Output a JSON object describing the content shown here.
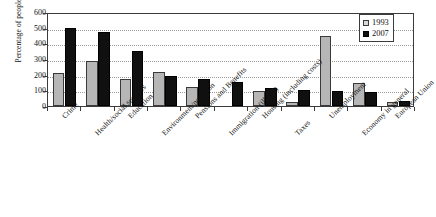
{
  "chart_data": {
    "type": "bar",
    "title": "",
    "xlabel": "",
    "ylabel": "Percentage of people",
    "ylim": [
      0,
      600
    ],
    "yticks": [
      0,
      100,
      200,
      300,
      400,
      500,
      600
    ],
    "ytick_labels": [
      "0",
      "100",
      "200",
      "300",
      "400",
      "500",
      "600"
    ],
    "grid": true,
    "legend_position": "top-right",
    "categories": [
      "Crime",
      "Health/social services",
      "Education",
      "Environment/pollution",
      "Pensions and Benefits",
      "Immigration (illegal)",
      "Housing (including costs)",
      "Taxes",
      "Unemployment",
      "Economy in general",
      "European Union"
    ],
    "series": [
      {
        "name": "1993",
        "color": "#b6b6b6",
        "values": [
          210,
          288,
          170,
          220,
          122,
          0,
          95,
          28,
          448,
          145,
          28
        ]
      },
      {
        "name": "2007",
        "color": "#101010",
        "values": [
          495,
          470,
          352,
          192,
          170,
          152,
          118,
          100,
          95,
          90,
          35
        ]
      }
    ]
  },
  "legend": {
    "entries": [
      {
        "label": "1993",
        "swatch": "legend-swatch-1993"
      },
      {
        "label": "2007",
        "swatch": "legend-swatch-2007"
      }
    ]
  }
}
